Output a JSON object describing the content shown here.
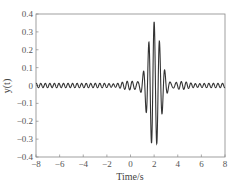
{
  "chart_data": {
    "type": "line",
    "title": "",
    "xlabel": "Time/s",
    "ylabel": "y(t)",
    "xlim": [
      -8,
      8
    ],
    "ylim": [
      -0.4,
      0.4
    ],
    "grid": false,
    "legend": null,
    "x_ticks": [
      -8,
      -6,
      -4,
      -2,
      0,
      2,
      4,
      6,
      8
    ],
    "x_tick_labels": [
      "−8",
      "−6",
      "−4",
      "−2",
      "0",
      "2",
      "4",
      "6",
      "8"
    ],
    "y_ticks": [
      0.4,
      0.3,
      0.2,
      0.1,
      0,
      -0.1,
      -0.2,
      -0.3,
      -0.4
    ],
    "y_tick_labels": [
      "0.4",
      "0.3",
      "0.2",
      "0.1",
      "0",
      "−0.1",
      "−0.2",
      "−0.3",
      "−0.4"
    ],
    "series": [
      {
        "name": "y(t)",
        "color": "#333333",
        "description": "Gaussian-windowed oscillation centred at t≈2 s, peak ≈0.31, min ≈−0.31, with small ripple (±0.01–0.03) across the full range",
        "model": {
          "center": 2.0,
          "amplitude": 0.31,
          "width": 0.7,
          "freq": 2.2,
          "ripple_amp": 0.012,
          "ripple_freq": 2.6,
          "mid_ripple_amp": 0.035,
          "mid_width": 2.2
        },
        "key_points": [
          {
            "t": 2.0,
            "y": 0.31
          },
          {
            "t": 2.23,
            "y": -0.3
          },
          {
            "t": 1.77,
            "y": -0.3
          },
          {
            "t": 2.45,
            "y": 0.26
          },
          {
            "t": 1.55,
            "y": 0.24
          },
          {
            "t": -8,
            "y": 0.0
          },
          {
            "t": 8,
            "y": 0.0
          }
        ]
      }
    ]
  }
}
